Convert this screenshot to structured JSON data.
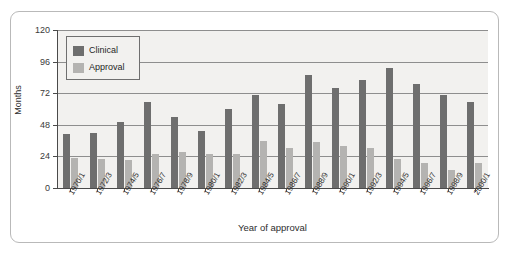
{
  "chart_data": {
    "type": "bar",
    "title": "",
    "xlabel": "Year of approval",
    "ylabel": "Months",
    "ylim": [
      0,
      120
    ],
    "yticks": [
      0,
      24,
      48,
      72,
      96,
      120
    ],
    "grid": true,
    "legend_position": "upper-left",
    "categories": [
      "1970/1",
      "1972/3",
      "1974/5",
      "1976/7",
      "1978/9",
      "1980/1",
      "1982/3",
      "1984/5",
      "1986/7",
      "1988/9",
      "1990/1",
      "1992/3",
      "1994/5",
      "1996/7",
      "1998/9",
      "2000/1"
    ],
    "series": [
      {
        "name": "Clinical",
        "color": "#6e6e6e",
        "values": [
          41,
          42,
          50,
          65,
          54,
          43,
          60,
          71,
          64,
          86,
          76,
          82,
          91,
          79,
          71,
          65
        ]
      },
      {
        "name": "Approval",
        "color": "#b4b3b1",
        "values": [
          23,
          22,
          21,
          26,
          27,
          26,
          26,
          36,
          30,
          35,
          32,
          30,
          22,
          19,
          14,
          19
        ]
      }
    ]
  },
  "legend": {
    "items": [
      {
        "label": "Clinical"
      },
      {
        "label": "Approval"
      }
    ]
  },
  "colors": {
    "clinical": "#6e6e6e",
    "approval": "#b4b3b1",
    "plot_background": "#f2f1ef",
    "gridline": "#8e8e8e",
    "axis": "#4a4a4a",
    "frame_border": "#b9b9b9"
  }
}
